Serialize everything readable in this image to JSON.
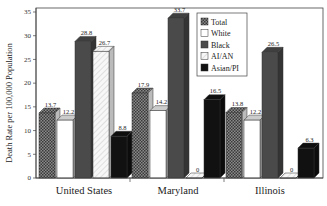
{
  "chart_data": {
    "type": "bar",
    "title": "",
    "xlabel": "",
    "ylabel": "Death Rate per 100,000 Population",
    "ylim": [
      0,
      35
    ],
    "yticks": [
      0,
      5,
      10,
      15,
      20,
      25,
      30,
      35
    ],
    "ytick_labels": [
      "0",
      "5",
      "10",
      "15",
      "20",
      "25",
      "30",
      "35"
    ],
    "categories": [
      "United States",
      "Maryland",
      "Illinois"
    ],
    "series": [
      {
        "name": "Total",
        "values": [
          13.7,
          17.9,
          13.8
        ],
        "labels": [
          "13.7",
          "17.9",
          "13.8"
        ],
        "fill": "crosshatch",
        "color": "#555555"
      },
      {
        "name": "White",
        "values": [
          12.2,
          14.2,
          12.2
        ],
        "labels": [
          "12.2",
          "14.2",
          "12.2"
        ],
        "fill": "solid",
        "color": "#ffffff"
      },
      {
        "name": "Black",
        "values": [
          28.8,
          33.7,
          26.5
        ],
        "labels": [
          "28.8",
          "33.7",
          "26.5"
        ],
        "fill": "solid",
        "color": "#4a4a4a"
      },
      {
        "name": "AI/AN",
        "values": [
          26.7,
          0,
          0
        ],
        "labels": [
          "26.7",
          "0",
          "0"
        ],
        "fill": "diagonal",
        "color": "#f2f2f2"
      },
      {
        "name": "Asian/PI",
        "values": [
          8.8,
          16.5,
          6.3
        ],
        "labels": [
          "8.8",
          "16.5",
          "6.3"
        ],
        "fill": "solid",
        "color": "#111111"
      }
    ],
    "legend": {
      "position": "top-center",
      "entries": [
        "Total",
        "White",
        "Black",
        "AI/AN",
        "Asian/PI"
      ]
    },
    "grid": false,
    "style": "3d-bars"
  }
}
